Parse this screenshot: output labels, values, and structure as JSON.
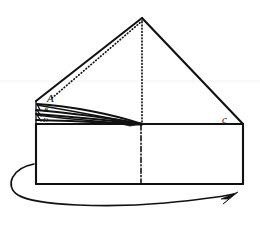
{
  "figure": {
    "background_color": "#ffffff",
    "ink_color": "#111111"
  },
  "labels": [
    {
      "id": "label-a",
      "text": "A",
      "x": 47,
      "y": 102,
      "size": "large"
    },
    {
      "id": "label-b",
      "text": "B",
      "x": 46,
      "y": 112,
      "size": "small"
    },
    {
      "id": "label-d",
      "text": "D",
      "x": 45,
      "y": 122,
      "size": "small"
    },
    {
      "id": "label-c",
      "text": "c",
      "x": 223,
      "y": 123,
      "size": "large"
    }
  ],
  "geometry": {
    "apex": {
      "x": 142,
      "y": 18
    },
    "triangle_left_vertex": {
      "x": 36,
      "y": 101
    },
    "triangle_right_vertex": {
      "x": 243,
      "y": 124
    },
    "box": {
      "left": 36,
      "top": 124,
      "right": 243,
      "bottom": 184
    },
    "center_fold_x": 141,
    "hidden_vertical": {
      "x": 142,
      "top": 22,
      "bottom": 124
    },
    "hidden_diagonal": {
      "from": {
        "x": 52,
        "y": 97
      },
      "to": {
        "x": 142,
        "y": 22
      }
    },
    "flap_convergence": {
      "x": 142,
      "y": 124
    },
    "rotation_arrow": {
      "start": {
        "x": 34,
        "y": 164
      },
      "tip": {
        "x": 238,
        "y": 197
      },
      "direction": "counterclockwise-sweep-right"
    }
  },
  "line_styles": {
    "solid_edge": "solid",
    "hidden_edge": "dotted",
    "fold_axis": "dash-dot",
    "motion": "curved-arrow"
  }
}
